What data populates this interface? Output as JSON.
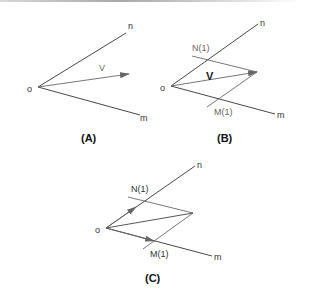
{
  "panels": {
    "A": {
      "caption": "(A)",
      "labels": {
        "origin": "o",
        "n": "n",
        "m": "m",
        "v": "V"
      }
    },
    "B": {
      "caption": "(B)",
      "labels": {
        "origin": "o",
        "n": "n",
        "m": "m",
        "v": "V",
        "n1": "N(1)",
        "m1": "M(1)"
      }
    },
    "C": {
      "caption": "(C)",
      "labels": {
        "origin": "o",
        "n": "n",
        "m": "m",
        "n1": "N(1)",
        "m1": "M(1)"
      }
    }
  },
  "colors": {
    "axis_line": "#333333",
    "construction_line": "#555555",
    "vector": "#666666"
  }
}
